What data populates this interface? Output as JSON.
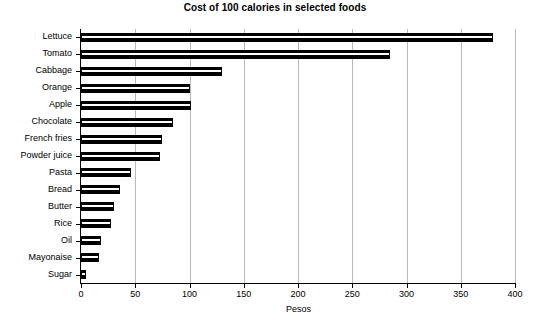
{
  "chart_data": {
    "type": "bar",
    "orientation": "horizontal",
    "title": "Cost of 100 calories in selected foods",
    "xlabel": "Pesos",
    "ylabel": "",
    "xlim": [
      0,
      400
    ],
    "ylim": [
      0,
      15
    ],
    "grid": true,
    "legend": null,
    "xticks": [
      0,
      50,
      100,
      150,
      200,
      250,
      300,
      350,
      400
    ],
    "xtick_labels": [
      "0",
      "50",
      "100",
      "150",
      "200",
      "250",
      "300",
      "350",
      "400"
    ],
    "categories": [
      "Lettuce",
      "Tomato",
      "Cabbage",
      "Orange",
      "Apple",
      "Chocolate",
      "French fries",
      "Powder juice",
      "Pasta",
      "Bread",
      "Butter",
      "Rice",
      "Oil",
      "Mayonaise",
      "Sugar"
    ],
    "values": [
      380,
      285,
      130,
      100,
      101,
      85,
      75,
      73,
      46,
      36,
      30,
      28,
      18,
      17,
      5
    ],
    "bar_color": "#000000",
    "grid_color": "#b9b9b9",
    "axis_color": "#000000"
  }
}
